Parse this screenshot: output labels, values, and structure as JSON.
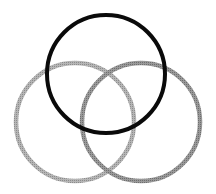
{
  "diagram": {
    "type": "venn",
    "background": "#ffffff",
    "circles": [
      {
        "id": "top",
        "cx": 106,
        "cy": 74,
        "r": 59,
        "stroke": "#0a0a0a",
        "stroke_width": 4
      },
      {
        "id": "left",
        "cx": 75,
        "cy": 122,
        "r": 59,
        "stroke": "#a8a8a8",
        "stroke_width": 4.5
      },
      {
        "id": "right",
        "cx": 141,
        "cy": 122,
        "r": 59,
        "stroke": "#8a8a8a",
        "stroke_width": 4.5
      }
    ]
  }
}
